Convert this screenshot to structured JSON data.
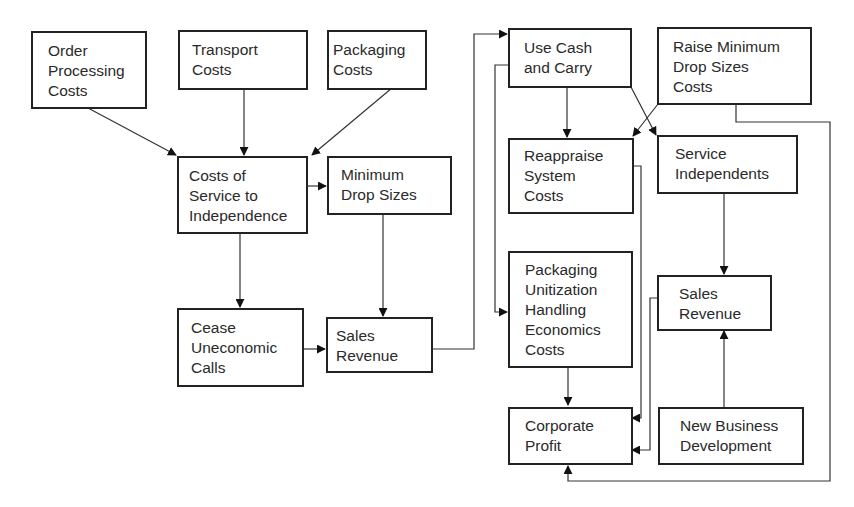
{
  "diagram": {
    "nodes": [
      {
        "id": "order_processing_costs",
        "label": "Order\nProcessing\nCosts",
        "trend": "up"
      },
      {
        "id": "transport_costs",
        "label": "Transport\nCosts",
        "trend": "up"
      },
      {
        "id": "packaging_costs",
        "label": "Packaging\nCosts",
        "trend": "up"
      },
      {
        "id": "costs_of_service",
        "label": "Costs of\nService to\nIndependence",
        "trend": "up"
      },
      {
        "id": "minimum_drop_sizes",
        "label": "Minimum\nDrop Sizes",
        "trend": "up"
      },
      {
        "id": "cease_uneconomic_calls",
        "label": "Cease\nUneconomic\nCalls",
        "trend": ""
      },
      {
        "id": "sales_revenue_left",
        "label": "Sales\nRevenue",
        "trend": "down"
      },
      {
        "id": "use_cash_and_carry",
        "label": "Use Cash\nand Carry",
        "trend": ""
      },
      {
        "id": "raise_minimum_drop_sizes",
        "label": "Raise Minimum\nDrop Sizes\nCosts",
        "trend": "down",
        "extra_symbol": "hollow-right-arrow"
      },
      {
        "id": "reappraise_system_costs",
        "label": "Reappraise\nSystem\nCosts",
        "trend": "down"
      },
      {
        "id": "service_independents",
        "label": "Service\nIndependents",
        "trend": ""
      },
      {
        "id": "packaging_unitization",
        "label": "Packaging\nUnitization\nHandling\nEconomics\nCosts",
        "trend": "down"
      },
      {
        "id": "sales_revenue_right",
        "label": "Sales\nRevenue",
        "trend": "up"
      },
      {
        "id": "corporate_profit",
        "label": "Corporate\nProfit",
        "trend": "up"
      },
      {
        "id": "new_business_development",
        "label": "New Business\nDevelopment",
        "trend": ""
      }
    ],
    "edges": [
      {
        "from": "order_processing_costs",
        "to": "costs_of_service"
      },
      {
        "from": "transport_costs",
        "to": "costs_of_service"
      },
      {
        "from": "packaging_costs",
        "to": "costs_of_service"
      },
      {
        "from": "costs_of_service",
        "to": "minimum_drop_sizes"
      },
      {
        "from": "costs_of_service",
        "to": "cease_uneconomic_calls"
      },
      {
        "from": "minimum_drop_sizes",
        "to": "sales_revenue_left"
      },
      {
        "from": "cease_uneconomic_calls",
        "to": "sales_revenue_left"
      },
      {
        "from": "sales_revenue_left",
        "to": "use_cash_and_carry"
      },
      {
        "from": "use_cash_and_carry",
        "to": "reappraise_system_costs"
      },
      {
        "from": "use_cash_and_carry",
        "to": "service_independents"
      },
      {
        "from": "use_cash_and_carry",
        "to": "packaging_unitization"
      },
      {
        "from": "raise_minimum_drop_sizes",
        "to": "reappraise_system_costs"
      },
      {
        "from": "raise_minimum_drop_sizes",
        "to": "corporate_profit"
      },
      {
        "from": "reappraise_system_costs",
        "to": "corporate_profit"
      },
      {
        "from": "service_independents",
        "to": "sales_revenue_right"
      },
      {
        "from": "packaging_unitization",
        "to": "corporate_profit"
      },
      {
        "from": "sales_revenue_right",
        "to": "corporate_profit"
      },
      {
        "from": "new_business_development",
        "to": "sales_revenue_right"
      }
    ]
  }
}
